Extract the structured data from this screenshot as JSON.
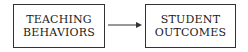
{
  "diagram": {
    "nodes": [
      {
        "id": "teaching-behaviors",
        "lines": [
          "TEACHING",
          "BEHAVIORS"
        ]
      },
      {
        "id": "student-outcomes",
        "lines": [
          "STUDENT",
          "OUTCOMES"
        ]
      }
    ],
    "edges": [
      {
        "from": "teaching-behaviors",
        "to": "student-outcomes"
      }
    ]
  }
}
